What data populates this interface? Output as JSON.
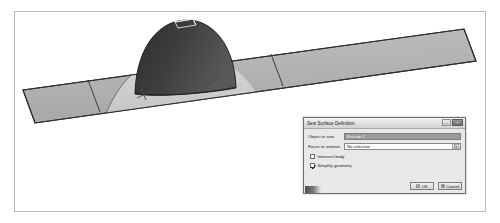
{
  "viewport": {
    "name": "cad-3d-viewport",
    "background_color": "#ffffff",
    "border_color": "#b9b9b9",
    "scene_description": "Shaded 3D CAD view of a dome surface intersecting an inclined rectangular planar surface",
    "geometry": {
      "plane": {
        "label": "inclined-planar-surface",
        "fill_color": "#b3b3b3",
        "edge_color": "#2c2c2c",
        "panel_divider_color": "#3a3a3a"
      },
      "dome": {
        "label": "dome-surface",
        "fill_color": "#3a3a3a",
        "shadow_fill_color": "#cfcfcf",
        "edge_color": "#1a1a1a"
      },
      "apex_box": {
        "label": "apex-wireframe-box",
        "edge_color": "#f2f2f2"
      },
      "normal_markers": {
        "label": "surface-normal-markers",
        "color": "#4a4a4a",
        "count": 2
      }
    }
  },
  "dialog": {
    "title": "Sew Surface Definition",
    "titlebar": {
      "minimize_glyph": "–",
      "close_glyph": "×"
    },
    "fields": [
      {
        "label": "Object to sew",
        "value": "Extrude.1",
        "state": "selected"
      },
      {
        "label": "Faces to remove",
        "value": "No selection",
        "state": "editable",
        "picker_icon": "selection-picker-icon"
      }
    ],
    "checkboxes": [
      {
        "label": "Intersect body",
        "checked": false
      },
      {
        "label": "Simplify geometry",
        "checked": true
      }
    ],
    "buttons": [
      {
        "label": "OK",
        "icon": "ok-icon"
      },
      {
        "label": "Cancel",
        "icon": "cancel-icon"
      }
    ]
  }
}
